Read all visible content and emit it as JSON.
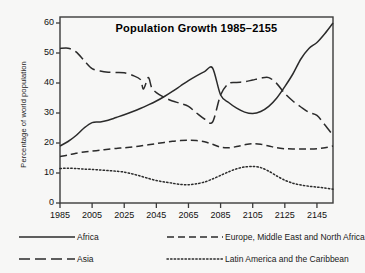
{
  "figure": {
    "background_color": "#f7f7f6",
    "frame_color": "#3b3b3b",
    "line_color": "#2b2b2b"
  },
  "chart_data": {
    "type": "line",
    "title": "Population Growth  1985–2155",
    "xlabel": "",
    "ylabel": "Percentage of world population",
    "xlim": [
      1985,
      2155
    ],
    "ylim": [
      0,
      62
    ],
    "yticks": [
      0,
      10,
      20,
      30,
      40,
      50,
      60
    ],
    "ytick_labels": [
      "0",
      "10",
      "20",
      "30",
      "40",
      "50",
      "60"
    ],
    "xticks": [
      1985,
      2005,
      2025,
      2045,
      2065,
      2085,
      2105,
      2125,
      2145
    ],
    "xtick_labels": [
      "1985",
      "2005",
      "2025",
      "2045",
      "2065",
      "2085",
      "2105",
      "2125",
      "2145"
    ],
    "grid": false,
    "legend_position": "below-axes",
    "series": [
      {
        "name": "Africa",
        "style": "solid",
        "x": [
          1985,
          1990,
          1995,
          2000,
          2005,
          2010,
          2015,
          2020,
          2025,
          2030,
          2035,
          2040,
          2045,
          2050,
          2055,
          2060,
          2065,
          2070,
          2075,
          2080,
          2085,
          2090,
          2095,
          2100,
          2105,
          2110,
          2115,
          2120,
          2125,
          2130,
          2135,
          2140,
          2145,
          2150,
          2155
        ],
        "values": [
          19.0,
          20.5,
          22.5,
          25.0,
          26.8,
          27.0,
          27.6,
          28.5,
          29.4,
          30.4,
          31.5,
          32.7,
          34.0,
          35.5,
          37.2,
          39.0,
          40.8,
          42.4,
          43.8,
          45.0,
          36.0,
          33.5,
          31.6,
          30.3,
          29.8,
          30.5,
          32.2,
          35.0,
          38.8,
          43.0,
          48.0,
          51.5,
          53.5,
          56.5,
          60.0
        ]
      },
      {
        "name": "Europe, Middle East and North Africa",
        "style": "dashed",
        "x": [
          1985,
          1990,
          1995,
          2000,
          2005,
          2010,
          2015,
          2020,
          2025,
          2030,
          2035,
          2040,
          2045,
          2050,
          2055,
          2060,
          2065,
          2070,
          2075,
          2080,
          2085,
          2090,
          2095,
          2100,
          2105,
          2110,
          2115,
          2120,
          2125,
          2130,
          2135,
          2140,
          2145,
          2150,
          2155
        ],
        "values": [
          15.5,
          16.0,
          16.6,
          17.0,
          17.3,
          17.6,
          17.9,
          18.2,
          18.4,
          18.7,
          19.0,
          19.4,
          19.8,
          20.2,
          20.6,
          20.8,
          20.9,
          20.8,
          20.4,
          19.6,
          18.6,
          18.4,
          18.8,
          19.4,
          19.8,
          19.6,
          19.0,
          18.4,
          18.1,
          18.0,
          18.0,
          18.0,
          18.1,
          18.4,
          19.0
        ]
      },
      {
        "name": "Asia",
        "style": "longdash",
        "x": [
          1985,
          1990,
          1995,
          2000,
          2005,
          2010,
          2015,
          2020,
          2025,
          2030,
          2035,
          2037,
          2040,
          2042,
          2045,
          2050,
          2055,
          2060,
          2065,
          2070,
          2075,
          2080,
          2085,
          2090,
          2095,
          2100,
          2105,
          2110,
          2115,
          2120,
          2125,
          2130,
          2135,
          2140,
          2145,
          2150,
          2155
        ],
        "values": [
          51.5,
          51.6,
          50.4,
          47.5,
          44.8,
          44.0,
          43.6,
          43.5,
          43.4,
          42.6,
          41.2,
          38.0,
          41.8,
          38.6,
          36.8,
          35.2,
          34.0,
          33.2,
          32.2,
          30.0,
          28.0,
          27.0,
          36.0,
          39.8,
          40.2,
          40.4,
          41.0,
          41.6,
          41.8,
          39.8,
          36.5,
          34.0,
          32.0,
          30.2,
          29.2,
          26.0,
          22.6
        ]
      },
      {
        "name": "Latin America and the Caribbean",
        "style": "dotted",
        "x": [
          1985,
          1990,
          1995,
          2000,
          2005,
          2010,
          2015,
          2020,
          2025,
          2030,
          2035,
          2040,
          2045,
          2050,
          2055,
          2060,
          2065,
          2070,
          2075,
          2080,
          2085,
          2090,
          2095,
          2100,
          2105,
          2110,
          2115,
          2120,
          2125,
          2130,
          2135,
          2140,
          2145,
          2150,
          2155
        ],
        "values": [
          11.5,
          11.6,
          11.5,
          11.3,
          11.2,
          11.0,
          10.8,
          10.6,
          10.3,
          9.7,
          9.0,
          8.2,
          7.5,
          7.0,
          6.6,
          6.2,
          6.1,
          6.4,
          7.0,
          8.0,
          9.2,
          10.4,
          11.4,
          12.0,
          12.2,
          11.8,
          10.6,
          9.0,
          7.6,
          6.6,
          6.0,
          5.6,
          5.3,
          5.0,
          4.6
        ]
      }
    ]
  },
  "legend": {
    "entries": [
      {
        "label": "Africa",
        "style": "solid"
      },
      {
        "label": "Europe, Middle East and North Africa",
        "style": "dashed"
      },
      {
        "label": "Asia",
        "style": "longdash"
      },
      {
        "label": "Latin America and the Caribbean",
        "style": "dotted"
      }
    ]
  }
}
